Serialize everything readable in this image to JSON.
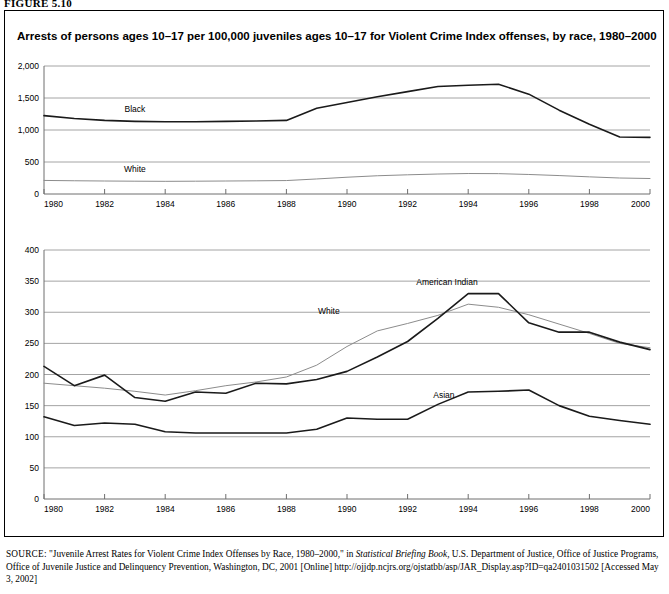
{
  "figure": {
    "number_label": "FIGURE 5.10",
    "title": "Arrests of persons ages 10–17 per 100,000 juveniles ages 10–17 for Violent Crime Index offenses, by race, 1980–2000"
  },
  "source": {
    "prefix": "SOURCE:",
    "text_1": " \"Juvenile Arrest Rates for Violent Crime Index Offenses by Race, 1980–2000,\" in ",
    "italic_1": "Statistical Briefing Book,",
    "text_2": " U.S. Department of Justice, Office of Justice Programs, Office of Juvenile Justice and Delinquency Prevention, Washington, DC, 2001 [Online] http://ojjdp.ncjrs.org/ojstatbb/asp/JAR_Display.asp?ID=qa2401031502  [Accessed May 3, 2002]"
  },
  "colors": {
    "dark_series": "#1a1a1a",
    "light_series": "#8c8c8c",
    "gridline": "#9a9a9a",
    "axis": "#6e6e6e",
    "frame": "#000000"
  },
  "chart_data": [
    {
      "type": "line",
      "id": "top-panel",
      "title": "Arrests of persons ages 10–17 per 100,000 juveniles ages 10–17 for Violent Crime Index offenses, by race, 1980–2000",
      "xlabel": "",
      "ylabel": "",
      "xlim": [
        1980,
        2000
      ],
      "ylim": [
        0,
        2000
      ],
      "yticks": [
        0,
        500,
        1000,
        1500,
        2000
      ],
      "ytick_labels": [
        "0",
        "500",
        "1,000",
        "1,500",
        "2,000"
      ],
      "xticks": [
        1980,
        1982,
        1984,
        1986,
        1988,
        1990,
        1992,
        1994,
        1996,
        1998,
        2000
      ],
      "xtick_labels": [
        "1980",
        "1982",
        "1984",
        "1986",
        "1988",
        "1990",
        "1992",
        "1994",
        "1996",
        "1998",
        "2000"
      ],
      "grid": true,
      "legend": "inline-labels",
      "x": [
        1980,
        1981,
        1982,
        1983,
        1984,
        1985,
        1986,
        1987,
        1988,
        1989,
        1990,
        1991,
        1992,
        1993,
        1994,
        1995,
        1996,
        1997,
        1998,
        1999,
        2000
      ],
      "series": [
        {
          "name": "Black",
          "color": "#1a1a1a",
          "label_x": 1983.0,
          "label_y": 1285,
          "values": [
            1225,
            1180,
            1150,
            1135,
            1130,
            1130,
            1135,
            1140,
            1150,
            1340,
            1430,
            1520,
            1600,
            1680,
            1700,
            1715,
            1560,
            1310,
            1090,
            890,
            885
          ]
        },
        {
          "name": "White",
          "color": "#8c8c8c",
          "label_x": 1983.0,
          "label_y": 345,
          "values": [
            212,
            207,
            203,
            200,
            198,
            200,
            203,
            206,
            210,
            235,
            262,
            285,
            300,
            312,
            320,
            318,
            305,
            288,
            268,
            250,
            242
          ]
        }
      ]
    },
    {
      "type": "line",
      "id": "bottom-panel",
      "title": "",
      "xlabel": "",
      "ylabel": "",
      "xlim": [
        1980,
        2000
      ],
      "ylim": [
        0,
        400
      ],
      "yticks": [
        0,
        50,
        100,
        150,
        200,
        250,
        300,
        350,
        400
      ],
      "ytick_labels": [
        "0",
        "50",
        "100",
        "150",
        "200",
        "250",
        "300",
        "350",
        "400"
      ],
      "xticks": [
        1980,
        1982,
        1984,
        1986,
        1988,
        1990,
        1992,
        1994,
        1996,
        1998,
        2000
      ],
      "xtick_labels": [
        "1980",
        "1982",
        "1984",
        "1986",
        "1988",
        "1990",
        "1992",
        "1994",
        "1996",
        "1998",
        "2000"
      ],
      "grid": true,
      "legend": "inline-labels",
      "x": [
        1980,
        1981,
        1982,
        1983,
        1984,
        1985,
        1986,
        1987,
        1988,
        1989,
        1990,
        1991,
        1992,
        1993,
        1994,
        1995,
        1996,
        1997,
        1998,
        1999,
        2000
      ],
      "series": [
        {
          "name": "American Indian",
          "color": "#1a1a1a",
          "label_x": 1993.3,
          "label_y": 343,
          "values": [
            213,
            182,
            199,
            163,
            157,
            172,
            170,
            186,
            185,
            192,
            205,
            228,
            253,
            290,
            330,
            330,
            283,
            268,
            268,
            252,
            240
          ]
        },
        {
          "name": "White",
          "color": "#8c8c8c",
          "label_x": 1989.4,
          "label_y": 297,
          "values": [
            186,
            182,
            178,
            173,
            167,
            174,
            182,
            188,
            196,
            215,
            245,
            270,
            282,
            295,
            313,
            308,
            296,
            281,
            266,
            250,
            243
          ]
        },
        {
          "name": "Asian",
          "color": "#1a1a1a",
          "label_x": 1993.2,
          "label_y": 162,
          "values": [
            132,
            118,
            122,
            120,
            108,
            106,
            106,
            106,
            106,
            112,
            130,
            128,
            128,
            152,
            172,
            173,
            175,
            150,
            133,
            126,
            120
          ]
        }
      ]
    }
  ]
}
